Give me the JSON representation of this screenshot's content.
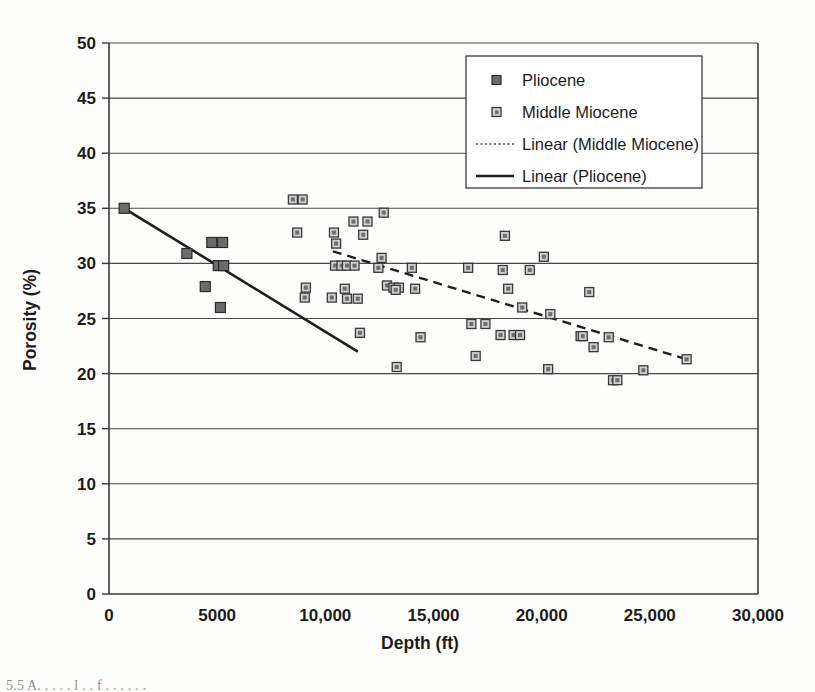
{
  "chart_data": {
    "type": "scatter",
    "title": "",
    "xlabel": "Depth (ft)",
    "ylabel": "Porosity (%)",
    "xlim": [
      0,
      30000
    ],
    "ylim": [
      0,
      50
    ],
    "xticks": [
      0,
      5000,
      10000,
      15000,
      20000,
      25000,
      30000
    ],
    "xtick_labels": [
      "0",
      "5000",
      "10,000",
      "15,000",
      "20,000",
      "25,000",
      "30,000"
    ],
    "yticks": [
      0,
      5,
      10,
      15,
      20,
      25,
      30,
      35,
      40,
      45,
      50
    ],
    "ytick_labels": [
      "0",
      "5",
      "10",
      "15",
      "20",
      "25",
      "30",
      "35",
      "40",
      "45",
      "50"
    ],
    "grid": "horizontal",
    "legend_position": "top-right",
    "series": [
      {
        "name": "Pliocene",
        "marker": "filled-square",
        "color": "#6b6b6b",
        "points": [
          [
            700,
            35.0
          ],
          [
            3600,
            30.9
          ],
          [
            4450,
            27.9
          ],
          [
            4750,
            31.9
          ],
          [
            5250,
            31.9
          ],
          [
            5050,
            29.8
          ],
          [
            5300,
            29.8
          ],
          [
            5150,
            26.0
          ]
        ]
      },
      {
        "name": "Middle Miocene",
        "marker": "open-square",
        "color": "#cfcfcf",
        "points": [
          [
            8500,
            35.8
          ],
          [
            8950,
            35.8
          ],
          [
            8700,
            32.8
          ],
          [
            9100,
            27.8
          ],
          [
            9050,
            26.9
          ],
          [
            10400,
            32.8
          ],
          [
            10500,
            31.8
          ],
          [
            10300,
            26.9
          ],
          [
            10450,
            29.8
          ],
          [
            10750,
            29.8
          ],
          [
            11000,
            29.8
          ],
          [
            11350,
            29.8
          ],
          [
            11300,
            33.8
          ],
          [
            11950,
            33.8
          ],
          [
            11750,
            32.6
          ],
          [
            11600,
            23.7
          ],
          [
            10900,
            27.7
          ],
          [
            11000,
            26.8
          ],
          [
            11500,
            26.8
          ],
          [
            12700,
            34.6
          ],
          [
            12600,
            30.5
          ],
          [
            12450,
            29.6
          ],
          [
            12850,
            28.0
          ],
          [
            13150,
            27.8
          ],
          [
            13400,
            27.8
          ],
          [
            13250,
            27.6
          ],
          [
            13300,
            20.6
          ],
          [
            14000,
            29.6
          ],
          [
            14150,
            27.7
          ],
          [
            14400,
            23.3
          ],
          [
            16600,
            29.6
          ],
          [
            16750,
            24.5
          ],
          [
            17400,
            24.5
          ],
          [
            16950,
            21.6
          ],
          [
            18300,
            32.5
          ],
          [
            18200,
            29.4
          ],
          [
            18450,
            27.7
          ],
          [
            18100,
            23.5
          ],
          [
            18700,
            23.5
          ],
          [
            19000,
            23.5
          ],
          [
            19100,
            26.0
          ],
          [
            19450,
            29.4
          ],
          [
            20100,
            30.6
          ],
          [
            20400,
            25.4
          ],
          [
            20300,
            20.4
          ],
          [
            21800,
            23.4
          ],
          [
            21900,
            23.4
          ],
          [
            22200,
            27.4
          ],
          [
            22400,
            22.4
          ],
          [
            23100,
            23.3
          ],
          [
            23300,
            19.4
          ],
          [
            23500,
            19.4
          ],
          [
            24700,
            20.3
          ],
          [
            26700,
            21.3
          ]
        ]
      }
    ],
    "trendlines": [
      {
        "name": "Linear (Pliocene)",
        "style": "solid",
        "x0": 700,
        "y0": 35.0,
        "x1": 11500,
        "y1": 22.0
      },
      {
        "name": "Linear (Middle Miocene)",
        "style": "dashed",
        "x0": 10350,
        "y0": 31.1,
        "x1": 26700,
        "y1": 21.3
      }
    ]
  },
  "legend": {
    "items": [
      {
        "label": "Pliocene",
        "glyph": "filled-square-marker"
      },
      {
        "label": "Middle Miocene",
        "glyph": "open-square-marker"
      },
      {
        "label": "Linear (Middle Miocene)",
        "glyph": "dotted-line"
      },
      {
        "label": "Linear (Pliocene)",
        "glyph": "solid-line"
      }
    ]
  },
  "caption": {
    "text": "5.5  A. . . . . l . . f . . . . . ."
  },
  "colors": {
    "pliocene_marker": "#6b6b6b",
    "miocene_marker": "#cfcfcf",
    "axis": "#3a3a3a",
    "grid": "#4a4a4a",
    "trend": "#1f1f1f"
  }
}
